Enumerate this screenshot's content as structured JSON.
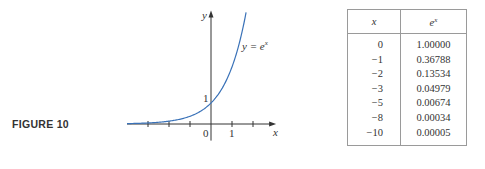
{
  "figure": {
    "label": "FIGURE 10"
  },
  "chart_data": [
    {
      "type": "line",
      "title": "",
      "function": "y = e^x",
      "curve_label": {
        "lhs": "y = e",
        "exp": "x"
      },
      "xlabel": "x",
      "ylabel": "y",
      "xlim": [
        -4,
        3.1
      ],
      "ylim": [
        -0.6,
        5.4
      ],
      "x_ticks": [
        -3,
        -2,
        -1,
        0,
        1,
        2
      ],
      "x_tick_labels": [
        {
          "value": 0,
          "text": "0"
        },
        {
          "value": 1,
          "text": "1"
        }
      ],
      "y_tick_labels": [
        {
          "value": 1,
          "text": "1"
        }
      ],
      "series": [
        {
          "name": "e^x",
          "color": "#3a72b8",
          "x_range": [
            -4,
            1.67
          ]
        }
      ],
      "grid": false
    },
    {
      "type": "table",
      "columns": [
        {
          "label": "x",
          "exp": ""
        },
        {
          "label": "e",
          "exp": "x"
        }
      ],
      "rows": [
        [
          "0",
          "1.00000"
        ],
        [
          "−1",
          "0.36788"
        ],
        [
          "−2",
          "0.13534"
        ],
        [
          "−3",
          "0.04979"
        ],
        [
          "−5",
          "0.00674"
        ],
        [
          "−8",
          "0.00034"
        ],
        [
          "−10",
          "0.00005"
        ]
      ]
    }
  ]
}
